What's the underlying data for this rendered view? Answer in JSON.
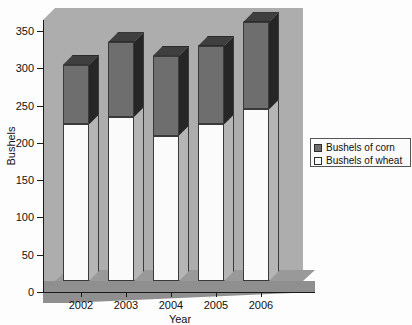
{
  "chart_data": {
    "type": "bar",
    "subtype": "stacked-column-3d",
    "title": "",
    "xlabel": "Year",
    "ylabel": "Bushels",
    "categories": [
      "2002",
      "2003",
      "2004",
      "2005",
      "2006"
    ],
    "series": [
      {
        "name": "Bushels of wheat",
        "color": "#ffffff",
        "values": [
          210,
          220,
          195,
          210,
          230
        ]
      },
      {
        "name": "Bushels of corn",
        "color": "#6e6e6e",
        "values": [
          80,
          100,
          107,
          105,
          117
        ]
      }
    ],
    "totals": [
      290,
      320,
      302,
      315,
      347
    ],
    "ylim": [
      0,
      350
    ],
    "yticks": [
      0,
      50,
      100,
      150,
      200,
      250,
      300,
      350
    ],
    "ytick_labels": [
      "0",
      "50",
      "100",
      "150",
      "200",
      "250",
      "300",
      "350"
    ],
    "grid": false,
    "legend_position": "right",
    "legend_entries": [
      "Bushels of corn",
      "Bushels of wheat"
    ],
    "plot_background": "#adadad"
  },
  "axes": {
    "y_title": "Bushels",
    "x_title": "Year"
  },
  "legend": {
    "items": [
      {
        "label": "Bushels of corn"
      },
      {
        "label": "Bushels of wheat"
      }
    ]
  }
}
